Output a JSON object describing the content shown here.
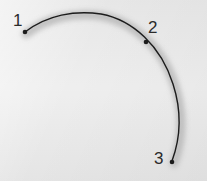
{
  "figure": {
    "background_color": "#e9e9e9",
    "width": 207,
    "height": 181
  },
  "curve": {
    "name": "arc-path",
    "stroke_color": "#1c1c1c",
    "stroke_width": 1.4,
    "halo_color": "#b9b9b9",
    "halo_width": 9,
    "description": "Open circular arc sweeping clockwise from lower-left, over the top, down the right side"
  },
  "points": [
    {
      "label": "1",
      "role": "start-point",
      "x": 25,
      "y": 32,
      "label_x": 13,
      "label_y": 12,
      "marker_color": "#1c1c1c"
    },
    {
      "label": "2",
      "role": "mid-point",
      "x": 146,
      "y": 42,
      "label_x": 148,
      "label_y": 19,
      "marker_color": "#1c1c1c"
    },
    {
      "label": "3",
      "role": "end-point",
      "x": 172,
      "y": 162,
      "label_x": 154,
      "label_y": 150,
      "marker_color": "#1c1c1c"
    }
  ],
  "chart_data": {
    "type": "line",
    "title": "",
    "xlabel": "",
    "ylabel": "",
    "xlim": [
      0,
      207
    ],
    "ylim": [
      181,
      0
    ],
    "grid": false,
    "legend": null,
    "series": [
      {
        "name": "arc",
        "x": [
          25,
          42,
          62,
          82,
          95,
          112,
          130,
          146,
          160,
          170,
          177,
          179,
          178,
          176,
          172
        ],
        "y": [
          32,
          22,
          15,
          13,
          13,
          18,
          28,
          42,
          60,
          80,
          100,
          115,
          132,
          148,
          162
        ]
      }
    ],
    "annotations": [
      {
        "text": "1",
        "x": 25,
        "y": 32
      },
      {
        "text": "2",
        "x": 146,
        "y": 42
      },
      {
        "text": "3",
        "x": 172,
        "y": 162
      }
    ]
  }
}
